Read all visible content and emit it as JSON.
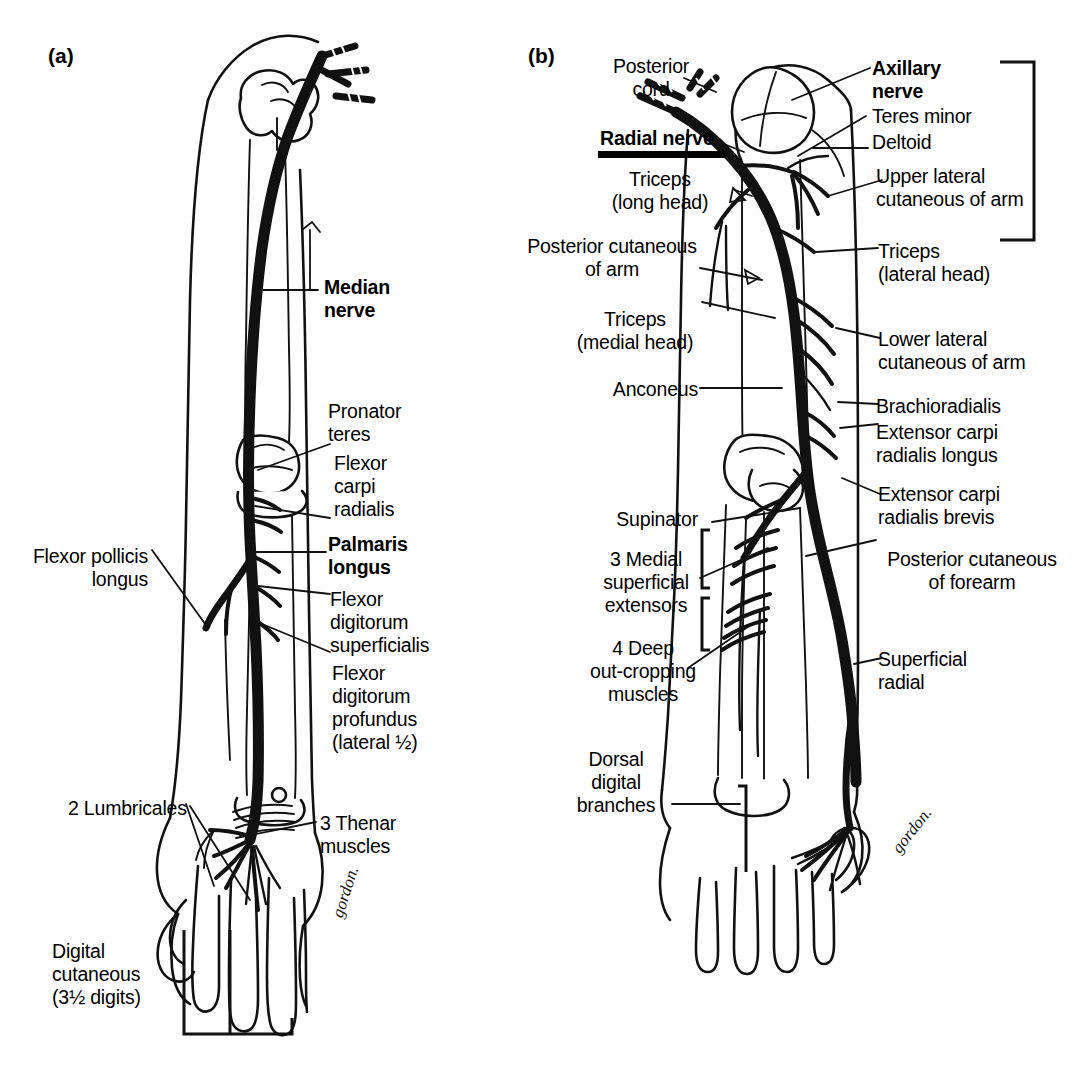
{
  "figure": {
    "signature": "gordon."
  },
  "panels": [
    {
      "tag": "(a)",
      "name": "median-nerve-panel",
      "main_nerve": "Median nerve",
      "labels": [
        {
          "id": "median-nerve",
          "text": "Median\nnerve",
          "bold": true
        },
        {
          "id": "pronator-teres",
          "text": "Pronator\nteres",
          "bold": false
        },
        {
          "id": "flexor-carpi-radialis",
          "text": "Flexor\ncarpi\nradialis",
          "bold": false
        },
        {
          "id": "palmaris-longus",
          "text": "Palmaris\nlongus",
          "bold": true
        },
        {
          "id": "flexor-pollicis-longus",
          "text": "Flexor pollicis\nlongus",
          "bold": false
        },
        {
          "id": "flexor-digitorum-superficialis",
          "text": "Flexor\ndigitorum\nsuperficialis",
          "bold": false
        },
        {
          "id": "flexor-digitorum-profundus",
          "text": "Flexor\ndigitorum\nprofundus\n(lateral ½)",
          "bold": false
        },
        {
          "id": "two-lumbricales",
          "text": "2 Lumbricales",
          "bold": false
        },
        {
          "id": "three-thenar-muscles",
          "text": "3 Thenar\nmuscles",
          "bold": false
        },
        {
          "id": "digital-cutaneous",
          "text": "Digital\ncutaneous\n(3½ digits)",
          "bold": false
        }
      ]
    },
    {
      "tag": "(b)",
      "name": "radial-nerve-panel",
      "main_nerve": "Radial nerve",
      "labels": [
        {
          "id": "posterior-cord",
          "text": "Posterior\ncord",
          "bold": false
        },
        {
          "id": "radial-nerve",
          "text": "Radial nerve",
          "bold": true
        },
        {
          "id": "triceps-long-head",
          "text": "Triceps\n(long head)",
          "bold": false
        },
        {
          "id": "posterior-cutaneous-of-arm",
          "text": "Posterior cutaneous\nof arm",
          "bold": false
        },
        {
          "id": "triceps-medial-head",
          "text": "Triceps\n(medial head)",
          "bold": false
        },
        {
          "id": "anconeus",
          "text": "Anconeus",
          "bold": false
        },
        {
          "id": "supinator",
          "text": "Supinator",
          "bold": false
        },
        {
          "id": "three-medial-superficial-extensors",
          "text": "3 Medial\nsuperficial\nextensors",
          "bold": false
        },
        {
          "id": "four-deep-outcropping-muscles",
          "text": "4 Deep\nout-cropping\nmuscles",
          "bold": false
        },
        {
          "id": "dorsal-digital-branches",
          "text": "Dorsal\ndigital\nbranches",
          "bold": false
        },
        {
          "id": "axillary-nerve",
          "text": "Axillary\nnerve",
          "bold": true
        },
        {
          "id": "teres-minor",
          "text": "Teres minor",
          "bold": false
        },
        {
          "id": "deltoid",
          "text": "Deltoid",
          "bold": false
        },
        {
          "id": "upper-lateral-cutaneous-of-arm",
          "text": "Upper lateral\ncutaneous of arm",
          "bold": false
        },
        {
          "id": "triceps-lateral-head",
          "text": "Triceps\n(lateral head)",
          "bold": false
        },
        {
          "id": "lower-lateral-cutaneous-of-arm",
          "text": "Lower lateral\ncutaneous of arm",
          "bold": false
        },
        {
          "id": "brachioradialis",
          "text": "Brachioradialis",
          "bold": false
        },
        {
          "id": "extensor-carpi-radialis-longus",
          "text": "Extensor carpi\nradialis longus",
          "bold": false
        },
        {
          "id": "extensor-carpi-radialis-brevis",
          "text": "Extensor carpi\nradialis brevis",
          "bold": false
        },
        {
          "id": "posterior-cutaneous-of-forearm",
          "text": "Posterior cutaneous\nof forearm",
          "bold": false
        },
        {
          "id": "superficial-radial",
          "text": "Superficial\nradial",
          "bold": false
        }
      ]
    }
  ],
  "text": {
    "panel_a_tag": "(a)",
    "panel_b_tag": "(b)",
    "median_nerve": "Median\nnerve",
    "pronator_teres": "Pronator\nteres",
    "flexor_carpi_radialis": "Flexor\ncarpi\nradialis",
    "palmaris_longus": "Palmaris\nlongus",
    "flexor_pollicis_longus": "Flexor pollicis\nlongus",
    "flexor_digitorum_superficialis": "Flexor\ndigitorum\nsuperficialis",
    "flexor_digitorum_profundus": "Flexor\ndigitorum\nprofundus\n(lateral ½)",
    "two_lumbricales": "2 Lumbricales",
    "three_thenar_muscles": "3 Thenar\nmuscles",
    "digital_cutaneous": "Digital\ncutaneous\n(3½ digits)",
    "posterior_cord": "Posterior\ncord",
    "radial_nerve": "Radial nerve",
    "triceps_long_head": "Triceps\n(long head)",
    "posterior_cutaneous_of_arm": "Posterior cutaneous\nof arm",
    "triceps_medial_head": "Triceps\n(medial head)",
    "anconeus": "Anconeus",
    "supinator": "Supinator",
    "three_medial_superficial_extensors": "3 Medial\nsuperficial\nextensors",
    "four_deep_outcropping_muscles": "4 Deep\nout-cropping\nmuscles",
    "dorsal_digital_branches": "Dorsal\ndigital\nbranches",
    "axillary_nerve": "Axillary\nnerve",
    "teres_minor": "Teres minor",
    "deltoid": "Deltoid",
    "upper_lateral_cutaneous_of_arm": "Upper lateral\ncutaneous of arm",
    "triceps_lateral_head": "Triceps\n(lateral head)",
    "lower_lateral_cutaneous_of_arm": "Lower lateral\ncutaneous of arm",
    "brachioradialis": "Brachioradialis",
    "extensor_carpi_radialis_longus": "Extensor carpi\nradialis longus",
    "extensor_carpi_radialis_brevis": "Extensor carpi\nradialis brevis",
    "posterior_cutaneous_of_forearm": "Posterior cutaneous\nof forearm",
    "superficial_radial": "Superficial\nradial",
    "signature_a": "gordon.",
    "signature_b": "gordon."
  },
  "colors": {
    "ink": "#000000",
    "paper": "#ffffff"
  }
}
